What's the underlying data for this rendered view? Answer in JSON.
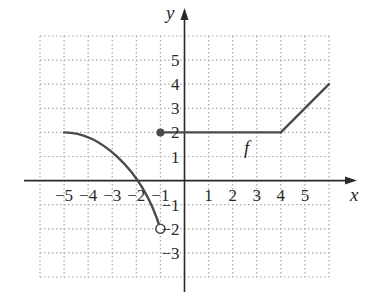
{
  "chart_data": {
    "type": "line",
    "title": "",
    "xlabel": "x",
    "ylabel": "y",
    "function_label": "f",
    "xlim": [
      -6,
      6
    ],
    "ylim": [
      -4,
      6
    ],
    "grid": true,
    "grid_style": "dotted",
    "x_ticks": [
      -5,
      -4,
      -3,
      -2,
      -1,
      1,
      2,
      3,
      4,
      5
    ],
    "x_tick_labels": [
      "−5",
      "−4",
      "−3",
      "−2",
      "−1",
      "1",
      "2",
      "3",
      "4",
      "5"
    ],
    "y_ticks": [
      5,
      4,
      3,
      2,
      1,
      -1,
      -2,
      -3
    ],
    "y_tick_labels": [
      "5",
      "4",
      "3",
      "2",
      "1",
      "−1",
      "−2",
      "−3"
    ],
    "series": [
      {
        "name": "f (curve piece)",
        "kind": "curve",
        "points": [
          [
            -5,
            2
          ],
          [
            -4,
            1.75
          ],
          [
            -3,
            1.0
          ],
          [
            -2,
            0
          ],
          [
            -1.5,
            -0.8
          ],
          [
            -1,
            -2
          ]
        ],
        "start_endpoint": "none",
        "end_endpoint": "open"
      },
      {
        "name": "f (constant piece)",
        "kind": "segment",
        "points": [
          [
            -1,
            2
          ],
          [
            4,
            2
          ]
        ],
        "start_endpoint": "closed",
        "end_endpoint": "none"
      },
      {
        "name": "f (linear piece)",
        "kind": "segment",
        "points": [
          [
            4,
            2
          ],
          [
            6,
            4
          ]
        ],
        "start_endpoint": "none",
        "end_endpoint": "none"
      }
    ],
    "markers": [
      {
        "x": -1,
        "y": 2,
        "type": "closed-dot"
      },
      {
        "x": -1,
        "y": -2,
        "type": "open-circle"
      }
    ],
    "colors": {
      "curve": "#4a4a4a",
      "axis": "#2a2a2a",
      "grid": "#a8a8a8"
    }
  }
}
